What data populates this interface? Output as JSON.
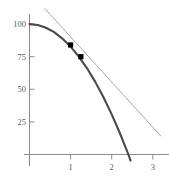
{
  "chart_data": {
    "type": "line",
    "title": "",
    "subtitle": "",
    "xlabel": "",
    "ylabel": "",
    "xlim": [
      -0.12,
      3.35
    ],
    "ylim": [
      -14,
      112
    ],
    "grid": false,
    "legend": "none",
    "x_ticks": [
      1,
      2,
      3
    ],
    "x_tick_labels": [
      "1",
      "2",
      "3"
    ],
    "y_ticks": [
      25,
      50,
      75,
      100
    ],
    "y_tick_labels": [
      "25",
      "50",
      "75",
      "100"
    ],
    "series": [
      {
        "name": "parabola",
        "type": "curve",
        "style": "solid",
        "color": "#4a4a4a",
        "width": 2.1,
        "equation": "y = 100 - 17.3 x^2",
        "x": [
          0,
          0.2,
          0.4,
          0.6,
          0.8,
          1.0,
          1.2,
          1.4,
          1.6,
          1.8,
          2.0,
          2.2,
          2.4,
          2.46
        ],
        "values": [
          100,
          99.3,
          97.2,
          93.8,
          88.9,
          82.7,
          75.1,
          66.1,
          55.7,
          43.9,
          30.8,
          16.3,
          0.4,
          -4.7
        ]
      },
      {
        "name": "secant-line",
        "type": "line",
        "style": "solid",
        "color": "#a8a8a8",
        "width": 1.0,
        "x": [
          0.37,
          3.2
        ],
        "values": [
          112,
          14
        ]
      }
    ],
    "points": [
      {
        "label": "point-1",
        "x": 1.0,
        "y": 84,
        "marker": "square",
        "color": "#000000"
      },
      {
        "label": "point-2",
        "x": 1.25,
        "y": 75,
        "marker": "square",
        "color": "#000000"
      }
    ]
  }
}
